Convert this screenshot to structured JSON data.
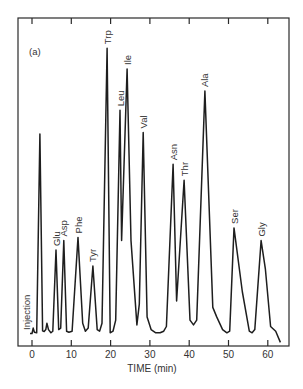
{
  "chart_data": {
    "type": "line",
    "title": "",
    "panel_label": "(a)",
    "xlabel": "TIME (min)",
    "ylabel": "",
    "xlim": [
      -3,
      65
    ],
    "ylim": [
      0,
      100
    ],
    "x_ticks": [
      0,
      10,
      20,
      30,
      40,
      50,
      60
    ],
    "x_tick_labels": [
      "0",
      "10",
      "20",
      "30",
      "40",
      "50",
      "60"
    ],
    "grid": false,
    "legend": null,
    "injection": {
      "label": "Injection",
      "time": 0
    },
    "peaks": [
      {
        "name": "",
        "time": 2.0,
        "height": 63.5
      },
      {
        "name": "",
        "time": 3.8,
        "height": 4
      },
      {
        "name": "Glu",
        "time": 6.1,
        "height": 27
      },
      {
        "name": "Asp",
        "time": 8.1,
        "height": 30
      },
      {
        "name": "Phe",
        "time": 11.7,
        "height": 31
      },
      {
        "name": "Tyr",
        "time": 15.5,
        "height": 22
      },
      {
        "name": "Trp",
        "time": 19.1,
        "height": 90.5
      },
      {
        "name": "Leu",
        "time": 22.4,
        "height": 71
      },
      {
        "name": "Ile",
        "time": 24.2,
        "height": 84
      },
      {
        "name": "Val",
        "time": 28.3,
        "height": 64
      },
      {
        "name": "Asn",
        "time": 35.9,
        "height": 54
      },
      {
        "name": "Thr",
        "time": 38.7,
        "height": 49
      },
      {
        "name": "Ala",
        "time": 44.0,
        "height": 77
      },
      {
        "name": "Ser",
        "time": 51.4,
        "height": 34
      },
      {
        "name": "Gly",
        "time": 58.3,
        "height": 30
      }
    ],
    "trace": {
      "x": [
        -0.5,
        0,
        0.3,
        0.6,
        1.2,
        2.0,
        2.7,
        3.1,
        3.5,
        3.8,
        4.2,
        4.8,
        5.3,
        6.1,
        6.8,
        7.3,
        8.1,
        8.8,
        9.4,
        10.2,
        11.7,
        12.9,
        13.6,
        14.3,
        15.5,
        16.6,
        17.2,
        17.8,
        19.1,
        19.9,
        20.6,
        21.3,
        22.4,
        22.8,
        24.2,
        25.2,
        26.7,
        27.3,
        28.3,
        29.3,
        30.3,
        31.5,
        32.6,
        33.5,
        34.2,
        35.9,
        36.8,
        38.7,
        40.2,
        41.1,
        41.9,
        44.0,
        46.0,
        47.0,
        48.5,
        49.6,
        50.3,
        51.4,
        53.5,
        55.3,
        56.0,
        56.7,
        58.3,
        59.4,
        60.7,
        62.0,
        63.2
      ],
      "y": [
        0.8,
        0.8,
        2.5,
        1.2,
        1.0,
        63.5,
        1.6,
        1.4,
        2.0,
        4.0,
        2.0,
        1.0,
        1.5,
        27,
        2.0,
        2.5,
        30,
        1.5,
        1.2,
        1.5,
        31,
        4.0,
        1.5,
        2.5,
        22,
        2.0,
        1.5,
        4.0,
        90.5,
        1.0,
        1.5,
        5.0,
        71,
        30,
        84,
        30,
        3.5,
        10,
        64,
        6.0,
        2.0,
        1.0,
        1.0,
        1.5,
        3.0,
        54,
        11,
        49,
        5.0,
        3.5,
        5.0,
        77,
        9.0,
        6.0,
        2.0,
        1.0,
        1.5,
        34,
        14,
        1.5,
        1.0,
        2.0,
        30,
        21,
        3.0,
        1.5,
        -2.0
      ]
    }
  }
}
